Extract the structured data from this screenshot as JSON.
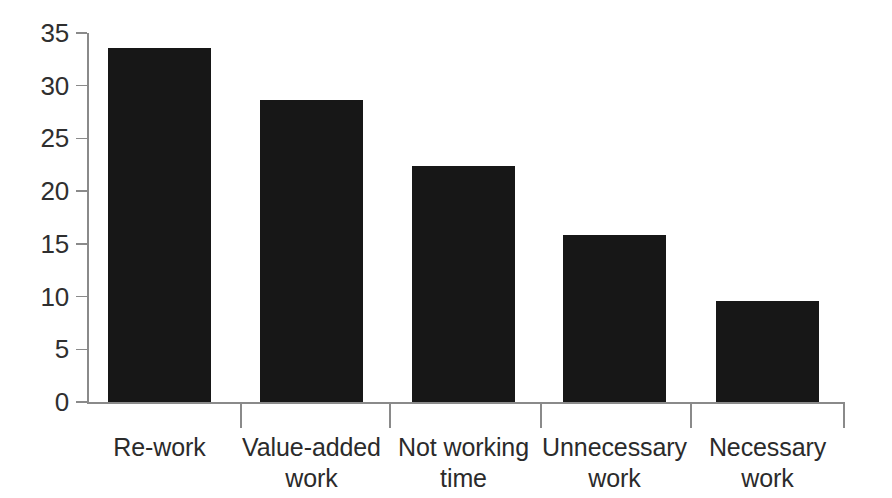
{
  "chart_data": {
    "type": "bar",
    "title": "",
    "subtitle": "",
    "xlabel": "",
    "ylabel": "",
    "categories": [
      "Re-work",
      "Value-added\nwork",
      "Not working\ntime",
      "Unnecessary\nwork",
      "Necessary\nwork"
    ],
    "values": [
      33.6,
      28.6,
      22.4,
      15.8,
      9.6
    ],
    "ylim": [
      0,
      35
    ],
    "yticks": [
      0,
      5,
      10,
      15,
      20,
      25,
      30,
      35
    ],
    "ytick_labels": [
      "0",
      "5",
      "10",
      "15",
      "20",
      "25",
      "30",
      "35"
    ],
    "grid": false,
    "legend": null,
    "legend_position": "none",
    "annotations": [],
    "colors": {
      "bar_fill": "#171717",
      "axis_line": "#8a8a8a",
      "tick_label": "#2f2f2f",
      "category_label": "#2b2b2b",
      "background": "#ffffff"
    }
  },
  "geometry": {
    "plot_left": 87,
    "plot_right": 844,
    "baseline_y": 402,
    "top_y": 33,
    "bar_width": 103,
    "bar_left_positions": [
      108,
      260,
      412,
      563,
      716
    ],
    "separator_x": [
      240,
      389,
      540,
      690,
      843
    ]
  }
}
